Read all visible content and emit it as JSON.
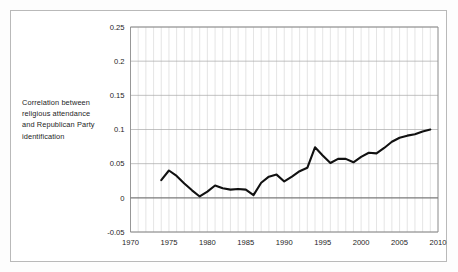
{
  "figure": {
    "axis_description": "Correlation between religious attendance and Republican Party identification",
    "frame_color": "#b9b9b9",
    "line_color": "#111111",
    "grid_color": "#d3d3d3"
  },
  "chart_data": {
    "type": "line",
    "title": "",
    "subtitle": "",
    "xlabel": "",
    "ylabel": "Correlation between religious attendance and Republican Party identification",
    "xlim": [
      1970,
      2010
    ],
    "ylim": [
      -0.05,
      0.25
    ],
    "yticks": [
      -0.05,
      0,
      0.05,
      0.1,
      0.15,
      0.2,
      0.25
    ],
    "ytick_labels": [
      "-0.05",
      "0",
      "0.05",
      "0.1",
      "0.15",
      "0.2",
      "0.25"
    ],
    "xticks": [
      1970,
      1975,
      1980,
      1985,
      1990,
      1995,
      2000,
      2005,
      2010
    ],
    "xtick_labels": [
      "1970",
      "1975",
      "1980",
      "1985",
      "1990",
      "1995",
      "2000",
      "2005",
      "2010"
    ],
    "grid": true,
    "grid_minor_x_every": 1,
    "legend": false,
    "legend_position": "none",
    "series": [
      {
        "name": "Correlation",
        "x": [
          1974,
          1975,
          1976,
          1977,
          1978,
          1979,
          1980,
          1981,
          1982,
          1983,
          1984,
          1985,
          1986,
          1987,
          1988,
          1989,
          1990,
          1991,
          1992,
          1993,
          1994,
          1995,
          1996,
          1997,
          1998,
          1999,
          2000,
          2001,
          2002,
          2003,
          2004,
          2005,
          2006,
          2007,
          2008,
          2009
        ],
        "values": [
          0.026,
          0.04,
          0.032,
          0.021,
          0.011,
          0.002,
          0.009,
          0.018,
          0.014,
          0.012,
          0.013,
          0.012,
          0.004,
          0.022,
          0.031,
          0.034,
          0.024,
          0.031,
          0.039,
          0.044,
          0.074,
          0.062,
          0.051,
          0.057,
          0.057,
          0.052,
          0.06,
          0.066,
          0.065,
          0.073,
          0.082,
          0.088,
          0.091,
          0.093,
          0.097,
          0.1
        ]
      }
    ]
  }
}
